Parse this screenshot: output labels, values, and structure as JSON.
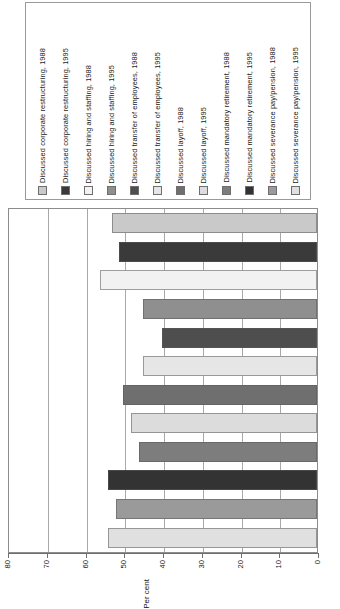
{
  "chart_data": {
    "type": "bar",
    "orientation": "horizontal",
    "title": "",
    "xlabel": "Per cent",
    "ylabel": "",
    "xlim": [
      0,
      80
    ],
    "xticks": [
      0,
      10,
      20,
      30,
      40,
      50,
      60,
      70,
      80
    ],
    "grid": true,
    "legend_position": "top",
    "categories": [
      "Discussed corporate restructuring, 1988",
      "Discussed corporate restructuring, 1995",
      "Discussed hiring and staffing, 1988",
      "Discussed hiring and staffing, 1995",
      "Discussed transfer of employees, 1988",
      "Discussed transfer of employees, 1995",
      "Discussed layoff, 1988",
      "Discussed layoff, 1995",
      "Discussed mandatory retirement, 1988",
      "Discussed mandatory retirement, 1995",
      "Discussed severance pay/pension, 1988",
      "Discussed severance pay/pension, 1995"
    ],
    "values": [
      53,
      51,
      56,
      45,
      40,
      45,
      50,
      48,
      46,
      54,
      52,
      54
    ],
    "colors": [
      "#c9c9c9",
      "#3a3a3a",
      "#f2f2f2",
      "#8f8f8f",
      "#4e4e4e",
      "#e6e6e6",
      "#6f6f6f",
      "#dcdcdc",
      "#7d7d7d",
      "#333333",
      "#9a9a9a",
      "#e0e0e0"
    ]
  },
  "legend": {
    "items": [
      {
        "label": "Discussed corporate restructuring, 1988",
        "color": "#c9c9c9"
      },
      {
        "label": "Discussed corporate restructuring, 1995",
        "color": "#3a3a3a"
      },
      {
        "label": "Discussed hiring and staffing, 1988",
        "color": "#f2f2f2"
      },
      {
        "label": "Discussed hiring and staffing, 1995",
        "color": "#8f8f8f"
      },
      {
        "label": "Discussed transfer of employees, 1988",
        "color": "#4e4e4e"
      },
      {
        "label": "Discussed transfer of employees, 1995",
        "color": "#e6e6e6"
      },
      {
        "label": "Discussed layoff, 1988",
        "color": "#6f6f6f"
      },
      {
        "label": "Discussed layoff, 1995",
        "color": "#dcdcdc"
      },
      {
        "label": "Discussed mandatory retirement, 1988",
        "color": "#7d7d7d"
      },
      {
        "label": "Discussed mandatory retirement, 1995",
        "color": "#333333"
      },
      {
        "label": "Discussed severance pay/pension, 1988",
        "color": "#9a9a9a"
      },
      {
        "label": "Discussed severance pay/pension, 1995",
        "color": "#e0e0e0"
      }
    ]
  },
  "axis": {
    "title": "Per cent",
    "tick_labels": [
      "80",
      "70",
      "60",
      "50",
      "40",
      "30",
      "20",
      "10",
      "0"
    ]
  }
}
